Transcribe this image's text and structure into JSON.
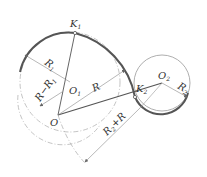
{
  "diagram": {
    "type": "geometric-construction",
    "colors": {
      "thick_line": "#555555",
      "thin_line": "#888888",
      "dashed_line": "#aaaaaa",
      "text": "#333333"
    },
    "points": {
      "K1": {
        "label": "K",
        "sub": "1",
        "x": 75,
        "y": 33
      },
      "O1": {
        "label": "O",
        "sub": "1",
        "x": 70,
        "y": 82
      },
      "O": {
        "label": "O",
        "sub": "",
        "x": 58,
        "y": 115
      },
      "K2": {
        "label": "K",
        "sub": "2",
        "x": 135,
        "y": 97
      },
      "O2": {
        "label": "O",
        "sub": "2",
        "x": 162,
        "y": 83
      }
    },
    "dimensions": {
      "R1": {
        "label": "R",
        "sub": "1"
      },
      "R_minus_R1": {
        "label": "R−R",
        "sub": "1"
      },
      "R": {
        "label": "R"
      },
      "R2": {
        "label": "R",
        "sub": "2"
      },
      "R2_plus_R": {
        "label_a": "R",
        "sub": "2",
        "label_b": "+R"
      }
    }
  }
}
